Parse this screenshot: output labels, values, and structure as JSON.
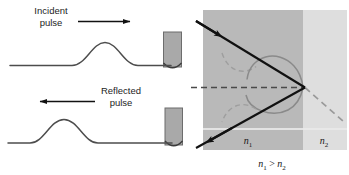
{
  "figure": {
    "panels": {
      "left": {
        "name": "string-pulse-reflection",
        "top_diagram": {
          "label_line1": "Incident",
          "label_line2": "pulse",
          "arrow_direction": "right"
        },
        "bottom_diagram": {
          "label_line1": "Reflected",
          "label_line2": "pulse",
          "arrow_direction": "left"
        }
      },
      "right": {
        "name": "total-internal-reflection",
        "medium_left_label": "n",
        "medium_left_subscript": "1",
        "medium_right_label": "n",
        "medium_right_subscript": "2",
        "relation_left": "n",
        "relation_left_sub": "1",
        "relation_operator": " > ",
        "relation_right": "n",
        "relation_right_sub": "2"
      }
    },
    "colors": {
      "medium_dense": "#b8b8b8",
      "medium_rare": "#dcdcdc",
      "ray": "#111111",
      "wavefront": "#8f8f8f",
      "wavefront_dashed": "#a2a2a2",
      "normal_dashed": "#4a4a4a",
      "string": "#4d4d4d",
      "post_fill": "#a9a9a9",
      "post_stroke": "#545454",
      "text": "#1d1d1d",
      "background": "#ffffff"
    }
  }
}
